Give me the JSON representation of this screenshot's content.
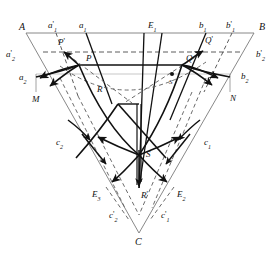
{
  "figure": {
    "type": "geometric-diagram",
    "title": "",
    "background": "#ffffff",
    "stroke_colors": {
      "thin": "#7a7a7a",
      "bold": "#111111",
      "dashed": "#555555",
      "faint": "#b4b4b4"
    }
  },
  "labels": {
    "A": {
      "base": "A",
      "sub": "",
      "prime": "",
      "x": 19,
      "y": 22
    },
    "a1p": {
      "base": "a",
      "sub": "1",
      "prime": "'",
      "x": 48,
      "y": 22
    },
    "a1": {
      "base": "a",
      "sub": "1",
      "prime": "",
      "x": 78,
      "y": 22
    },
    "E1": {
      "base": "E",
      "sub": "1",
      "prime": "",
      "x": 148,
      "y": 22
    },
    "b1": {
      "base": "b",
      "sub": "1",
      "prime": "",
      "x": 198,
      "y": 22
    },
    "b1p": {
      "base": "b",
      "sub": "1",
      "prime": "'",
      "x": 227,
      "y": 22
    },
    "B": {
      "base": "B",
      "sub": "",
      "prime": "",
      "x": 258,
      "y": 22
    },
    "Pp": {
      "base": "P",
      "sub": "",
      "prime": "'",
      "x": 58,
      "y": 39
    },
    "Qp": {
      "base": "Q",
      "sub": "",
      "prime": "'",
      "x": 204,
      "y": 38
    },
    "a2p": {
      "base": "a",
      "sub": "2",
      "prime": "'",
      "x": 8,
      "y": 52
    },
    "b2p": {
      "base": "b",
      "sub": "2",
      "prime": "'",
      "x": 257,
      "y": 52
    },
    "P": {
      "base": "P",
      "sub": "",
      "prime": "",
      "x": 86,
      "y": 56
    },
    "Q": {
      "base": "Q",
      "sub": "",
      "prime": "",
      "x": 186,
      "y": 56
    },
    "a2": {
      "base": "a",
      "sub": "2",
      "prime": "",
      "x": 21,
      "y": 76
    },
    "b2": {
      "base": "b",
      "sub": "2",
      "prime": "",
      "x": 242,
      "y": 75
    },
    "Sdot": {
      "base": "S",
      "sub": "",
      "prime": "",
      "x": 171,
      "y": 82
    },
    "M": {
      "base": "M",
      "sub": "",
      "prime": "",
      "x": 33,
      "y": 97
    },
    "N": {
      "base": "N",
      "sub": "",
      "prime": "",
      "x": 231,
      "y": 96
    },
    "R": {
      "base": "R",
      "sub": "",
      "prime": "",
      "x": 97,
      "y": 87
    },
    "c2": {
      "base": "c",
      "sub": "2",
      "prime": "",
      "x": 58,
      "y": 140
    },
    "c1": {
      "base": "c",
      "sub": "1",
      "prime": "",
      "x": 203,
      "y": 140
    },
    "S": {
      "base": "S",
      "sub": "",
      "prime": "",
      "x": 146,
      "y": 152
    },
    "E3": {
      "base": "E",
      "sub": "3",
      "prime": "",
      "x": 94,
      "y": 192
    },
    "E2": {
      "base": "E",
      "sub": "2",
      "prime": "",
      "x": 178,
      "y": 192
    },
    "Rp": {
      "base": "R",
      "sub": "",
      "prime": "'",
      "x": 140,
      "y": 193
    },
    "c2p": {
      "base": "c",
      "sub": "2",
      "prime": "'",
      "x": 110,
      "y": 213
    },
    "c1p": {
      "base": "c",
      "sub": "1",
      "prime": "'",
      "x": 161,
      "y": 213
    },
    "C": {
      "base": "C",
      "sub": "",
      "prime": "",
      "x": 136,
      "y": 238
    }
  },
  "points": {
    "A": {
      "x": 26,
      "y": 33
    },
    "B": {
      "x": 254,
      "y": 33
    },
    "C": {
      "x": 139,
      "y": 233
    },
    "P": {
      "x": 79,
      "y": 65
    },
    "Q": {
      "x": 182,
      "y": 65
    },
    "R": {
      "x": 118,
      "y": 104
    },
    "S": {
      "x": 139,
      "y": 155
    },
    "Rp": {
      "x": 139,
      "y": 187
    },
    "Pp": {
      "x": 64,
      "y": 52
    },
    "Qp": {
      "x": 204,
      "y": 50
    },
    "M": {
      "x": 36,
      "y": 89
    },
    "N": {
      "x": 230,
      "y": 89
    },
    "a2": {
      "x": 36,
      "y": 74
    },
    "b2": {
      "x": 230,
      "y": 74
    },
    "E3": {
      "x": 106,
      "y": 187
    },
    "E2": {
      "x": 174,
      "y": 187
    }
  }
}
